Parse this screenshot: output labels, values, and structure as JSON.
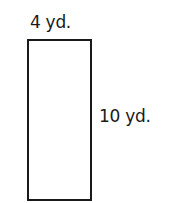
{
  "diagram": {
    "shape": "rectangle",
    "width_label": "4 yd.",
    "height_label": "10 yd.",
    "stroke_color": "#1a1a1a"
  }
}
